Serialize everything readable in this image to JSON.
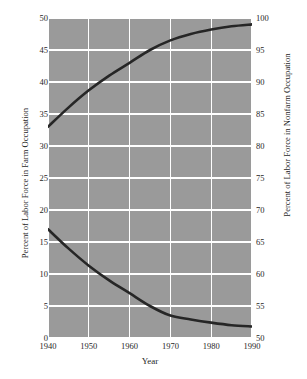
{
  "chart_data": {
    "type": "line",
    "title": "",
    "xlabel": "Year",
    "ylabel": "Percent of Labor Force in Farm Occupation",
    "y2label": "Percent of Labor Force in Nonfarm Occupation",
    "x": [
      1940,
      1945,
      1950,
      1955,
      1960,
      1965,
      1970,
      1975,
      1980,
      1985,
      1990
    ],
    "xlim": [
      1940,
      1990
    ],
    "xticks": [
      1940,
      1950,
      1960,
      1970,
      1980,
      1990
    ],
    "ylim": [
      0,
      50
    ],
    "yticks": [
      0,
      5,
      10,
      15,
      20,
      25,
      30,
      35,
      40,
      45,
      50
    ],
    "y2lim": [
      50,
      100
    ],
    "y2ticks": [
      50,
      55,
      60,
      65,
      70,
      75,
      80,
      85,
      90,
      95,
      100
    ],
    "grid": true,
    "legend": "none",
    "plot_background": "#9a9a9a",
    "grid_color": "#ffffff",
    "line_color": "#262626",
    "series": [
      {
        "name": "Percent of Labor Force in Nonfarm Occupation",
        "axis": "right",
        "values": [
          83.0,
          86.0,
          88.7,
          91.0,
          93.0,
          95.0,
          96.5,
          97.5,
          98.2,
          98.7,
          99.0
        ]
      },
      {
        "name": "Percent of Labor Force in Farm Occupation",
        "axis": "left",
        "values": [
          17.0,
          14.0,
          11.3,
          9.0,
          7.0,
          5.0,
          3.5,
          2.9,
          2.4,
          2.0,
          1.8
        ]
      }
    ]
  }
}
